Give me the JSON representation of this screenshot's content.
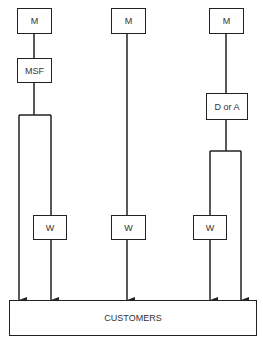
{
  "diagram": {
    "type": "distribution-channels",
    "channels": [
      {
        "id": "channel-1",
        "producer": "M",
        "intermediary": "MSF",
        "split_paths": [
          "direct",
          "via-wholesaler"
        ],
        "wholesaler": "W"
      },
      {
        "id": "channel-2",
        "producer": "M",
        "wholesaler": "W"
      },
      {
        "id": "channel-3",
        "producer": "M",
        "intermediary": "D or A",
        "split_paths": [
          "via-wholesaler",
          "direct"
        ],
        "wholesaler": "W"
      }
    ],
    "labels": {
      "m1": "M",
      "m2": "M",
      "m3": "M",
      "msf": "MSF",
      "d_or_a": "D or A",
      "w1": "W",
      "w2": "W",
      "w3": "W",
      "customers": "CUSTOMERS"
    },
    "colors": {
      "line": "#222222",
      "box_border": "#222222",
      "text": "#333333",
      "background": "#ffffff"
    }
  }
}
